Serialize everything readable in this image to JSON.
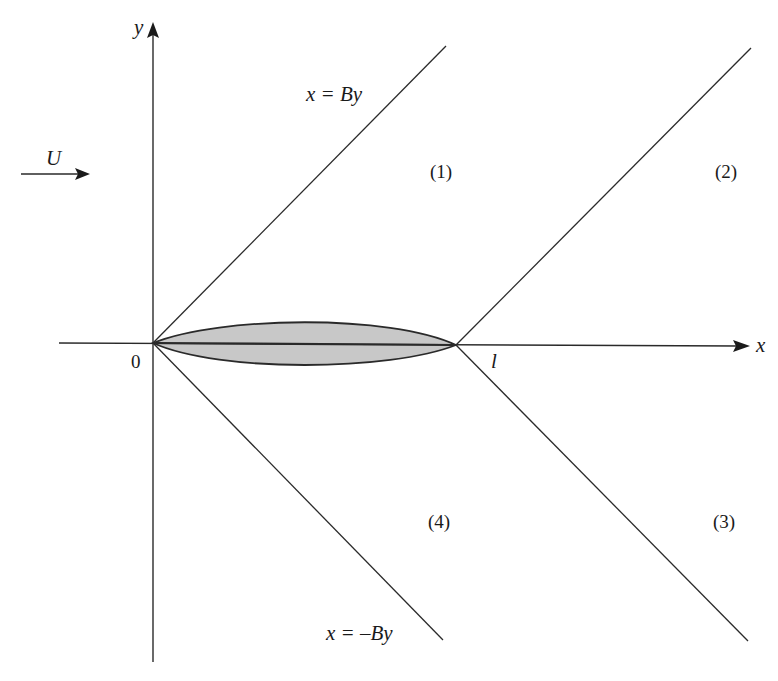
{
  "diagram": {
    "axes": {
      "x_label": "x",
      "y_label": "y",
      "origin_label": "0",
      "chord_end_label": "l"
    },
    "freestream": {
      "label": "U",
      "direction": "right"
    },
    "mach_lines": [
      {
        "id": "leading-upper",
        "equation": "x = By",
        "label_shown": true
      },
      {
        "id": "leading-lower",
        "equation": "x = –By",
        "label_shown": true
      },
      {
        "id": "trailing-upper",
        "equation": "",
        "label_shown": false
      },
      {
        "id": "trailing-lower",
        "equation": "",
        "label_shown": false
      }
    ],
    "regions": [
      {
        "label": "(1)",
        "position": "upper, between leading and trailing Mach lines"
      },
      {
        "label": "(2)",
        "position": "upper, downstream of trailing Mach line"
      },
      {
        "label": "(3)",
        "position": "lower, downstream of trailing Mach line"
      },
      {
        "label": "(4)",
        "position": "lower, between leading and trailing Mach lines"
      }
    ],
    "body": {
      "shape": "biconvex thin airfoil",
      "fill_color": "#c8c8c8"
    }
  }
}
